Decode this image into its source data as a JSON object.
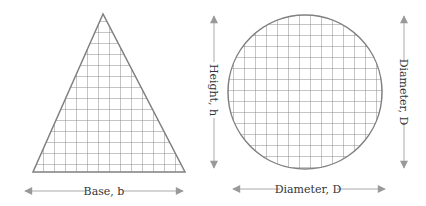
{
  "figure": {
    "triangle": {
      "shape": "triangle",
      "fill_pattern": "grid",
      "base_label": "Base, b",
      "height_label": "Height, h"
    },
    "circle": {
      "shape": "circle",
      "fill_pattern": "grid",
      "horizontal_label": "Diameter, D",
      "vertical_label": "Diameter, D"
    },
    "colors": {
      "outline": "#808080",
      "grid": "#8a8a8a",
      "arrow": "#999999",
      "text": "#333333"
    }
  }
}
